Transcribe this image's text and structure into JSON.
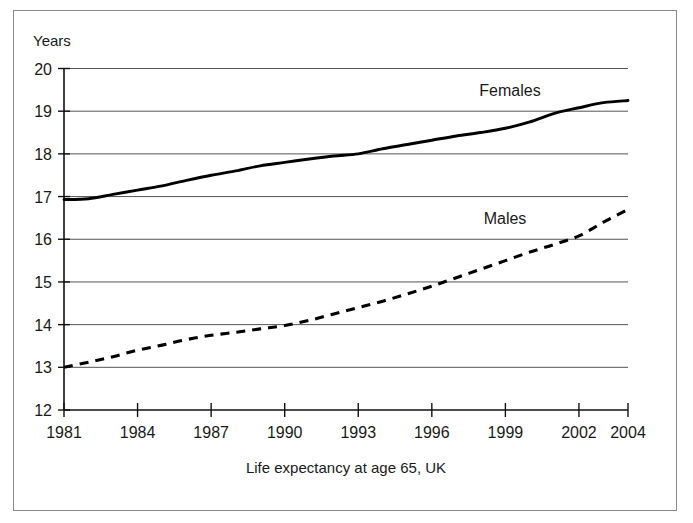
{
  "figure": {
    "y_axis_title": "Years",
    "caption": "Life expectancy at age 65, UK"
  },
  "labels": {
    "females": "Females",
    "males": "Males"
  },
  "y_ticks": [
    "12",
    "13",
    "14",
    "15",
    "16",
    "17",
    "18",
    "19",
    "20"
  ],
  "x_ticks": [
    "1981",
    "1984",
    "1987",
    "1990",
    "1993",
    "1996",
    "1999",
    "2002",
    "2004"
  ],
  "chart_data": {
    "type": "line",
    "title": "",
    "subtitle": "",
    "caption": "Life expectancy at age 65, UK",
    "xlabel": "",
    "ylabel": "Years",
    "xlim": [
      1981,
      2004
    ],
    "ylim": [
      12,
      20
    ],
    "y_tick_values": [
      12,
      13,
      14,
      15,
      16,
      17,
      18,
      19,
      20
    ],
    "x_tick_values": [
      1981,
      1984,
      1987,
      1990,
      1993,
      1996,
      1999,
      2002,
      2004
    ],
    "grid": "horizontal",
    "legend": "inline-labels",
    "x": [
      1981,
      1982,
      1983,
      1984,
      1985,
      1986,
      1987,
      1988,
      1989,
      1990,
      1991,
      1992,
      1993,
      1994,
      1995,
      1996,
      1997,
      1998,
      1999,
      2000,
      2001,
      2002,
      2003,
      2004
    ],
    "series": [
      {
        "name": "Females",
        "style": "solid",
        "color": "#000000",
        "values": [
          16.93,
          16.95,
          17.05,
          17.15,
          17.25,
          17.38,
          17.5,
          17.6,
          17.72,
          17.8,
          17.88,
          17.95,
          18.0,
          18.12,
          18.22,
          18.32,
          18.42,
          18.5,
          18.6,
          18.75,
          18.95,
          19.08,
          19.2,
          19.25
        ]
      },
      {
        "name": "Males",
        "style": "dashed",
        "color": "#000000",
        "values": [
          13.0,
          13.12,
          13.25,
          13.4,
          13.52,
          13.65,
          13.75,
          13.82,
          13.9,
          13.98,
          14.1,
          14.25,
          14.4,
          14.55,
          14.72,
          14.9,
          15.1,
          15.3,
          15.5,
          15.7,
          15.88,
          16.08,
          16.4,
          16.7
        ]
      }
    ],
    "annotations": [
      {
        "text": "Females",
        "x": 1999.5,
        "y": 19.45
      },
      {
        "text": "Males",
        "x": 1999.2,
        "y": 16.62
      }
    ]
  }
}
